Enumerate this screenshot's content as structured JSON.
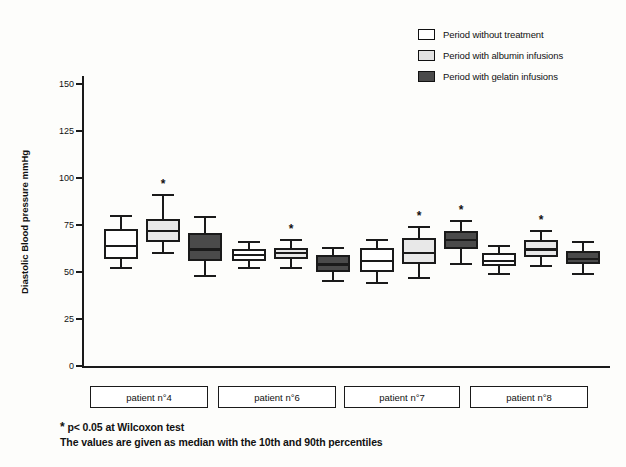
{
  "chart_data": {
    "type": "box",
    "title": "",
    "xlabel": "",
    "ylabel": "Diastolic Blood pressure mmHg",
    "ylim": [
      0,
      150
    ],
    "yticks": [
      0,
      25,
      50,
      75,
      100,
      125,
      150
    ],
    "grid": false,
    "legend_position": "top-right",
    "legend": [
      {
        "key": "none",
        "label": "Period without treatment",
        "color": "#ffffff"
      },
      {
        "key": "albumin",
        "label": "Period with albumin infusions",
        "color": "#e8e8e8"
      },
      {
        "key": "gelatin",
        "label": "Period with gelatin infusions",
        "color": "#4a4a4a"
      }
    ],
    "categories": [
      "patient n°4",
      "patient n°6",
      "patient n°7",
      "patient n°8"
    ],
    "note_symbol": "*",
    "series": [
      {
        "name": "Period without treatment",
        "fill": "#ffffff",
        "boxes": [
          {
            "category": "patient n°4",
            "whisker_low": 52,
            "q1": 57,
            "median": 64,
            "q3": 73,
            "whisker_high": 80,
            "significant": false
          },
          {
            "category": "patient n°6",
            "whisker_low": 52,
            "q1": 56,
            "median": 59,
            "q3": 62,
            "whisker_high": 66,
            "significant": false
          },
          {
            "category": "patient n°7",
            "whisker_low": 44,
            "q1": 50,
            "median": 56,
            "q3": 63,
            "whisker_high": 67,
            "significant": false
          },
          {
            "category": "patient n°8",
            "whisker_low": 49,
            "q1": 53,
            "median": 56,
            "q3": 60,
            "whisker_high": 64,
            "significant": false
          }
        ]
      },
      {
        "name": "Period with albumin infusions",
        "fill": "#e8e8e8",
        "boxes": [
          {
            "category": "patient n°4",
            "whisker_low": 60,
            "q1": 66,
            "median": 72,
            "q3": 78,
            "whisker_high": 91,
            "significant": true
          },
          {
            "category": "patient n°6",
            "whisker_low": 52,
            "q1": 57,
            "median": 60,
            "q3": 63,
            "whisker_high": 67,
            "significant": true
          },
          {
            "category": "patient n°7",
            "whisker_low": 47,
            "q1": 54,
            "median": 60,
            "q3": 68,
            "whisker_high": 74,
            "significant": true
          },
          {
            "category": "patient n°8",
            "whisker_low": 53,
            "q1": 58,
            "median": 62,
            "q3": 67,
            "whisker_high": 72,
            "significant": true
          }
        ]
      },
      {
        "name": "Period with gelatin infusions",
        "fill": "#4a4a4a",
        "boxes": [
          {
            "category": "patient n°4",
            "whisker_low": 48,
            "q1": 56,
            "median": 62,
            "q3": 71,
            "whisker_high": 79,
            "significant": false
          },
          {
            "category": "patient n°6",
            "whisker_low": 45,
            "q1": 50,
            "median": 54,
            "q3": 59,
            "whisker_high": 63,
            "significant": false
          },
          {
            "category": "patient n°7",
            "whisker_low": 54,
            "q1": 62,
            "median": 67,
            "q3": 72,
            "whisker_high": 77,
            "significant": true
          },
          {
            "category": "patient n°8",
            "whisker_low": 49,
            "q1": 54,
            "median": 57,
            "q3": 61,
            "whisker_high": 66,
            "significant": false
          }
        ]
      }
    ],
    "annotations": [
      "* p< 0.05 at Wilcoxon test",
      "The values are given as median with the 10th and 90th percentiles"
    ]
  },
  "footnotes": {
    "line1_symbol": "*",
    "line1": " p< 0.05 at Wilcoxon test",
    "line2": "The values are given as median with the 10th and 90th percentiles"
  }
}
